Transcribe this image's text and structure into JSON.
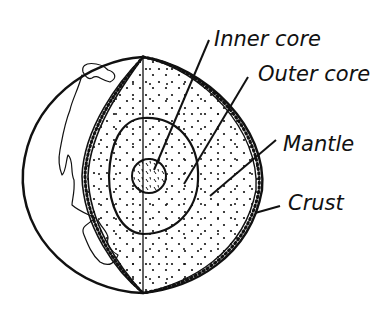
{
  "diagram": {
    "labels": [
      {
        "id": "inner-core",
        "text": "Inner core",
        "x": 214,
        "y": 46
      },
      {
        "id": "outer-core",
        "text": "Outer core",
        "x": 258,
        "y": 81
      },
      {
        "id": "mantle",
        "text": "Mantle",
        "x": 283,
        "y": 151
      },
      {
        "id": "crust",
        "text": "Crust",
        "x": 288,
        "y": 210
      }
    ],
    "colors": {
      "ink": "#111111",
      "background": "#ffffff"
    }
  }
}
